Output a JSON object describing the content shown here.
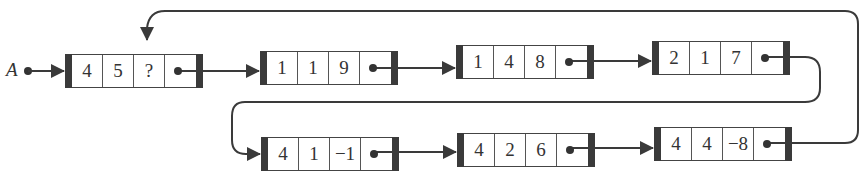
{
  "diagram": {
    "type": "linked-list",
    "head_label": "A",
    "colors": {
      "line": "#3a3a3a",
      "text": "#333333",
      "background": "#ffffff"
    },
    "nodes": [
      {
        "values": [
          "4",
          "5",
          "?"
        ],
        "row": 1
      },
      {
        "values": [
          "1",
          "1",
          "9"
        ],
        "row": 1
      },
      {
        "values": [
          "1",
          "4",
          "8"
        ],
        "row": 1
      },
      {
        "values": [
          "2",
          "1",
          "7"
        ],
        "row": 1
      },
      {
        "values": [
          "4",
          "1",
          "−1"
        ],
        "row": 2
      },
      {
        "values": [
          "4",
          "2",
          "6"
        ],
        "row": 2
      },
      {
        "values": [
          "4",
          "4",
          "−8"
        ],
        "row": 2
      }
    ],
    "edges": [
      {
        "from": "A",
        "to": 0
      },
      {
        "from": 0,
        "to": 1
      },
      {
        "from": 1,
        "to": 2
      },
      {
        "from": 2,
        "to": 3
      },
      {
        "from": 3,
        "to": 4,
        "note": "wraps to second row"
      },
      {
        "from": 4,
        "to": 5
      },
      {
        "from": 5,
        "to": 6
      },
      {
        "from": 6,
        "to": "node-0-third-field",
        "note": "loops back to '?' field of first node"
      }
    ]
  }
}
